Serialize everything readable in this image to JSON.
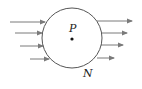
{
  "diagram": {
    "labels": {
      "center_point": "P",
      "surface": "N"
    },
    "colors": {
      "circle": "#555555",
      "arrows": "#7a7a7a",
      "text": "#222222"
    },
    "circle": {
      "cx": 72,
      "cy": 38,
      "r": 30
    },
    "arrows_in": [
      {
        "x1": 10,
        "y1": 22,
        "x2": 45,
        "y2": 22
      },
      {
        "x1": 15,
        "y1": 33,
        "x2": 42,
        "y2": 33
      },
      {
        "x1": 20,
        "y1": 46,
        "x2": 43,
        "y2": 46
      },
      {
        "x1": 30,
        "y1": 59,
        "x2": 49,
        "y2": 59
      }
    ],
    "arrows_out": [
      {
        "x1": 97,
        "y1": 21,
        "x2": 132,
        "y2": 21
      },
      {
        "x1": 101,
        "y1": 33,
        "x2": 127,
        "y2": 33
      },
      {
        "x1": 101,
        "y1": 45,
        "x2": 123,
        "y2": 45
      },
      {
        "x1": 97,
        "y1": 58,
        "x2": 114,
        "y2": 58
      }
    ]
  }
}
